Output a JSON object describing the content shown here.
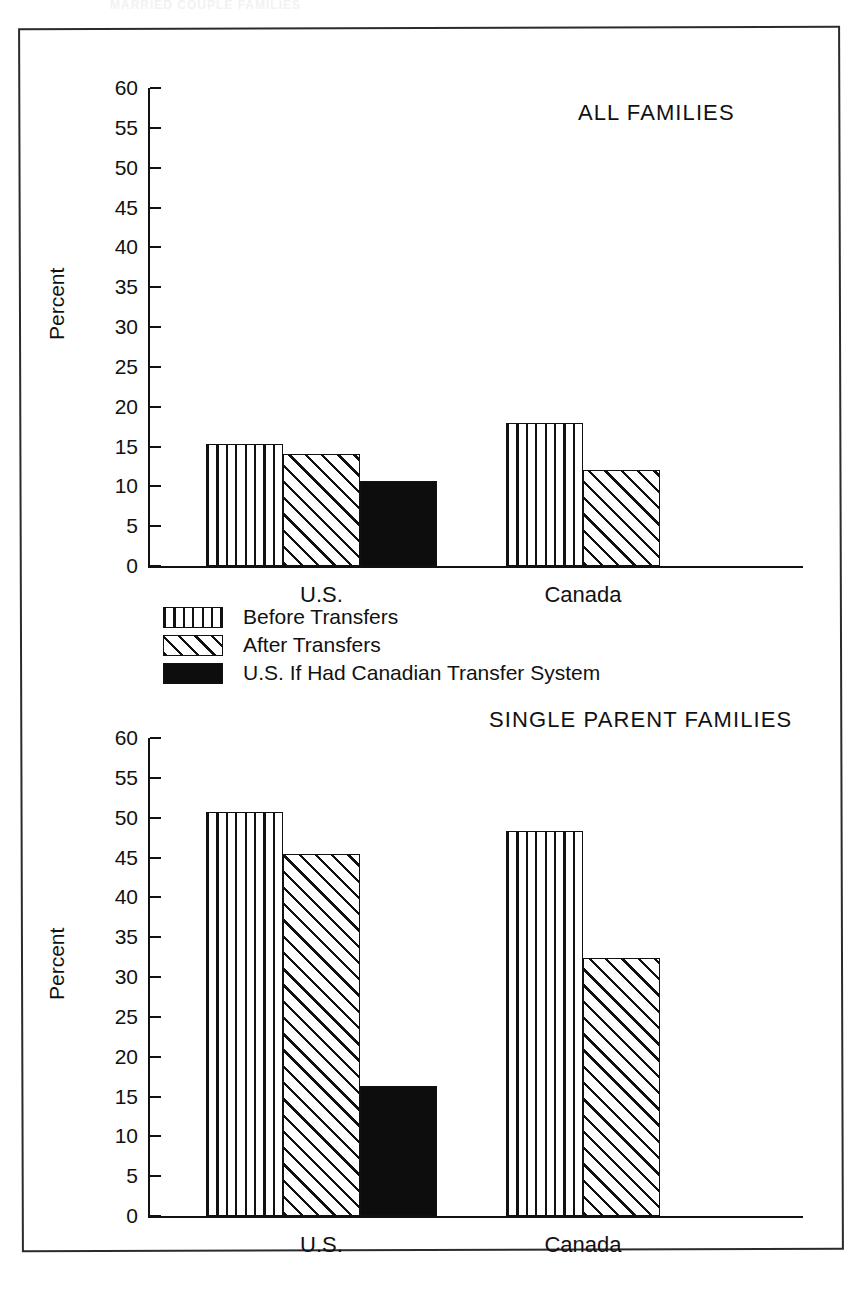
{
  "ghost_header": "MARRIED COUPLE FAMILIES",
  "legend": {
    "items": [
      {
        "label": "Before Transfers",
        "pattern": "vertical-stripes"
      },
      {
        "label": "After Transfers",
        "pattern": "diagonal-stripes"
      },
      {
        "label": "U.S. If Had Canadian Transfer System",
        "pattern": "solid-black"
      }
    ]
  },
  "colors": {
    "ink": "#111111",
    "paper": "#ffffff"
  },
  "chart_data": [
    {
      "type": "bar",
      "title": "ALL FAMILIES",
      "xlabel": "",
      "ylabel": "Percent",
      "ylim": [
        0,
        60
      ],
      "yticks": [
        0,
        5,
        10,
        15,
        20,
        25,
        30,
        35,
        40,
        45,
        50,
        55,
        60
      ],
      "grid": false,
      "legend_position": "below-plot",
      "categories": [
        "U.S.",
        "Canada"
      ],
      "series": [
        {
          "name": "Before Transfers",
          "values": [
            15.3,
            18.0
          ]
        },
        {
          "name": "After Transfers",
          "values": [
            14.1,
            12.0
          ]
        },
        {
          "name": "U.S. If Had Canadian Transfer System",
          "values": [
            10.7,
            null
          ]
        }
      ]
    },
    {
      "type": "bar",
      "title": "SINGLE PARENT  FAMILIES",
      "xlabel": "",
      "ylabel": "Percent",
      "ylim": [
        0,
        60
      ],
      "yticks": [
        0,
        5,
        10,
        15,
        20,
        25,
        30,
        35,
        40,
        45,
        50,
        55,
        60
      ],
      "grid": false,
      "legend_position": "above-plot",
      "categories": [
        "U.S.",
        "Canada"
      ],
      "series": [
        {
          "name": "Before Transfers",
          "values": [
            50.7,
            48.3
          ]
        },
        {
          "name": "After Transfers",
          "values": [
            45.4,
            32.4
          ]
        },
        {
          "name": "U.S. If Had Canadian Transfer System",
          "values": [
            16.3,
            null
          ]
        }
      ]
    }
  ]
}
